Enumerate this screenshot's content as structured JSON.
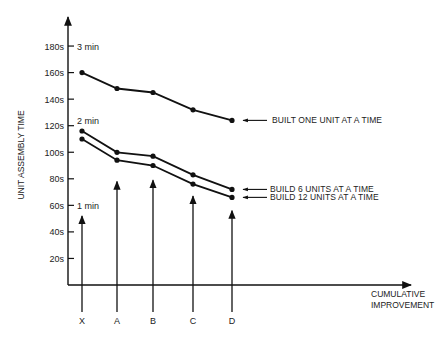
{
  "chart_data": {
    "type": "line",
    "title": "",
    "xlabel": "CUMULATIVE IMPROVEMENT",
    "ylabel": "UNIT ASSEMBLY TIME",
    "categories": [
      "X",
      "A",
      "B",
      "C",
      "D"
    ],
    "yticks": [
      "20s",
      "40s",
      "60s",
      "80s",
      "100s",
      "120s",
      "140s",
      "160s",
      "180s"
    ],
    "ytick_values": [
      20,
      40,
      60,
      80,
      100,
      120,
      140,
      160,
      180
    ],
    "ylim": [
      0,
      200
    ],
    "grid": false,
    "annotations": [
      {
        "text": "1 min",
        "at_value": 60
      },
      {
        "text": "2 min",
        "at_value": 120
      },
      {
        "text": "3 min",
        "at_value": 180
      }
    ],
    "improvement_arrows": [
      {
        "category": "X",
        "tip_value": 52
      },
      {
        "category": "A",
        "tip_value": 78
      },
      {
        "category": "B",
        "tip_value": 79
      },
      {
        "category": "C",
        "tip_value": 67
      },
      {
        "category": "D",
        "tip_value": 56
      }
    ],
    "series": [
      {
        "name": "BUILT ONE UNIT AT A TIME",
        "values": [
          160,
          148,
          145,
          132,
          124
        ]
      },
      {
        "name": "BUILD 6 UNITS AT A TIME",
        "values": [
          116,
          100,
          97,
          83,
          72
        ]
      },
      {
        "name": "BUILD 12 UNITS AT A TIME",
        "values": [
          110,
          94,
          90,
          76,
          66
        ]
      }
    ],
    "legend_position": "right, arrow-pointed labels at line ends"
  }
}
